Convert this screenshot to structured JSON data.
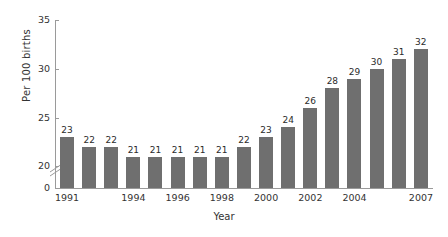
{
  "chart_data": {
    "type": "bar",
    "title": "",
    "subtitle": "",
    "xlabel": "Year",
    "ylabel": "Per 100 births",
    "categories": [
      "1991",
      "1992",
      "1993",
      "1994",
      "1995",
      "1996",
      "1997",
      "1998",
      "1999",
      "2000",
      "2001",
      "2002",
      "2003",
      "2004",
      "2005",
      "2006",
      "2007"
    ],
    "values": [
      23,
      22,
      22,
      21,
      21,
      21,
      21,
      21,
      22,
      23,
      24,
      26,
      28,
      29,
      30,
      31,
      32
    ],
    "data_labels": [
      "23",
      "22",
      "22",
      "21",
      "21",
      "21",
      "21",
      "21",
      "22",
      "23",
      "24",
      "26",
      "28",
      "29",
      "30",
      "31",
      "32"
    ],
    "ylim": [
      0,
      35
    ],
    "y_ticks": [
      0,
      20,
      25,
      30,
      35
    ],
    "y_tick_labels": [
      "0",
      "20",
      "25",
      "30",
      "35"
    ],
    "y_axis_break": true,
    "y_axis_break_between": [
      0,
      20
    ],
    "x_tick_labels": [
      "1991",
      "1994",
      "1996",
      "1998",
      "2000",
      "2002",
      "2004",
      "2007"
    ],
    "x_tick_indices": [
      0,
      3,
      5,
      7,
      9,
      11,
      13,
      16
    ],
    "grid": false,
    "legend": false,
    "bar_color": "#6f6f6f",
    "axis_color": "#9a9a9a",
    "text_color": "#2b2b2b",
    "background": "#ffffff"
  }
}
